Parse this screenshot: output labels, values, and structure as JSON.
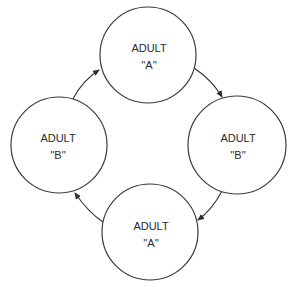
{
  "diagram": {
    "type": "cycle",
    "nodes": [
      {
        "id": "top",
        "line1": "ADULT",
        "line2": "''A''",
        "cx": 148,
        "cy": 55,
        "r": 48
      },
      {
        "id": "right",
        "line1": "ADULT",
        "line2": "''B''",
        "cx": 237,
        "cy": 145,
        "r": 49
      },
      {
        "id": "bottom",
        "line1": "ADULT",
        "line2": "''A''",
        "cx": 150,
        "cy": 232,
        "r": 48
      },
      {
        "id": "left",
        "line1": "ADULT",
        "line2": "''B''",
        "cx": 59,
        "cy": 145,
        "r": 48
      }
    ],
    "edges": [
      {
        "from": "top",
        "to": "right",
        "direction": "clockwise"
      },
      {
        "from": "right",
        "to": "bottom",
        "direction": "clockwise"
      },
      {
        "from": "bottom",
        "to": "left",
        "direction": "clockwise"
      },
      {
        "from": "left",
        "to": "top",
        "direction": "clockwise"
      }
    ],
    "colors": {
      "stroke": "#3a3a3a",
      "text": "#2a2a2a",
      "background": "#ffffff"
    }
  }
}
